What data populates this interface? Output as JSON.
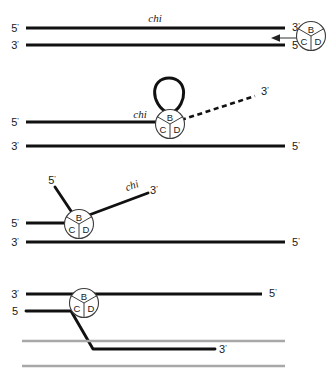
{
  "figure": {
    "colors": {
      "strand_black": "#111111",
      "strand_gray": "#a8a8a8",
      "complex_outline": "#3d3d3d",
      "background": "#ffffff"
    },
    "complex": {
      "name": "RecBCD",
      "subunits": {
        "top": "B",
        "bottom_left": "C",
        "bottom_right": "D"
      }
    },
    "chi_label": "chi",
    "panels": [
      {
        "id": "panel-1",
        "caption": "Intact duplex DNA with chi site; RecBCD enzyme approaches from the right end",
        "labels": {
          "top_left": "5",
          "top_right": "3",
          "bottom_left": "3",
          "bottom_right": "5",
          "chi": "chi"
        }
      },
      {
        "id": "panel-2",
        "caption": "RecBCD translocates along the duplex unwinding DNA, generating a single-strand loop ahead of the enzyme",
        "labels": {
          "top_left": "5",
          "bottom_left": "3",
          "bottom_right": "5",
          "dashed_end": "3",
          "chi": "chi"
        }
      },
      {
        "id": "panel-3",
        "caption": "Both unwound single strands splay out from the enzyme; chi sequence appears on the 3' tail",
        "labels": {
          "upper_branch": "5",
          "chi_branch": "3",
          "left": "5",
          "bottom_left": "3",
          "bottom_right": "5",
          "chi": "chi"
        }
      },
      {
        "id": "panel-4",
        "caption": "The chi-containing 3' single strand invades a homologous recipient duplex shown in gray",
        "labels": {
          "top_left": "3",
          "top_right": "5",
          "second_left": "5",
          "invading_end": "3"
        }
      }
    ]
  }
}
